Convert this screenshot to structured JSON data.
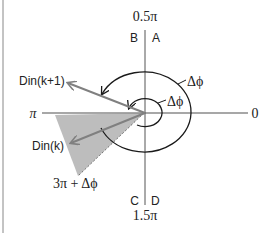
{
  "diagram": {
    "type": "phase-plane",
    "axes": {
      "top_label": "0.5π",
      "bottom_label": "1.5π",
      "left_label": "π",
      "right_label": "0"
    },
    "quadrants": {
      "top_left": "B",
      "top_right": "A",
      "bottom_left": "C",
      "bottom_right": "D"
    },
    "vectors": [
      {
        "label": "Din(k+1)"
      },
      {
        "label": "Din(k)"
      }
    ],
    "arc_labels": {
      "outer": "Δϕ",
      "inner": "Δϕ"
    },
    "region_label": "3π + Δϕ",
    "colors": {
      "axis": "#8a8a8a",
      "arc": "#1a1a1a",
      "vector": "#808080",
      "region_fill": "#bdbdbd",
      "frame": "#888888"
    }
  }
}
